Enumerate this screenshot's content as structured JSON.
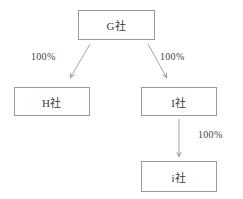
{
  "diagram": {
    "stroke_color": "#9a9a9a",
    "text_color": "#3a3a3a",
    "background_color": "#ffffff",
    "nodes": [
      {
        "id": "g",
        "label": "G社"
      },
      {
        "id": "h",
        "label": "H社"
      },
      {
        "id": "i",
        "label": "I社"
      },
      {
        "id": "i2",
        "label": "i社"
      }
    ],
    "edges": [
      {
        "id": "g-h",
        "from": "g",
        "to": "h",
        "label": "100%"
      },
      {
        "id": "g-i",
        "from": "g",
        "to": "i",
        "label": "100%"
      },
      {
        "id": "i-i2",
        "from": "i",
        "to": "i2",
        "label": "100%"
      }
    ]
  }
}
